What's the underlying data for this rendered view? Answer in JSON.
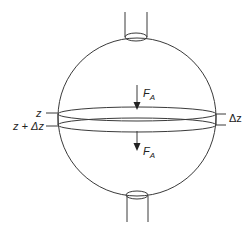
{
  "diagram": {
    "type": "sphere-slice-force-balance",
    "labels": {
      "force_top": "F",
      "force_top_sub": "A",
      "force_bottom": "F",
      "force_bottom_sub": "A",
      "z_upper": "z",
      "z_lower": "z + Δz",
      "thickness": "Δz"
    },
    "colors": {
      "stroke": "#3a3a3a",
      "text": "#222222",
      "background": "#ffffff"
    }
  }
}
